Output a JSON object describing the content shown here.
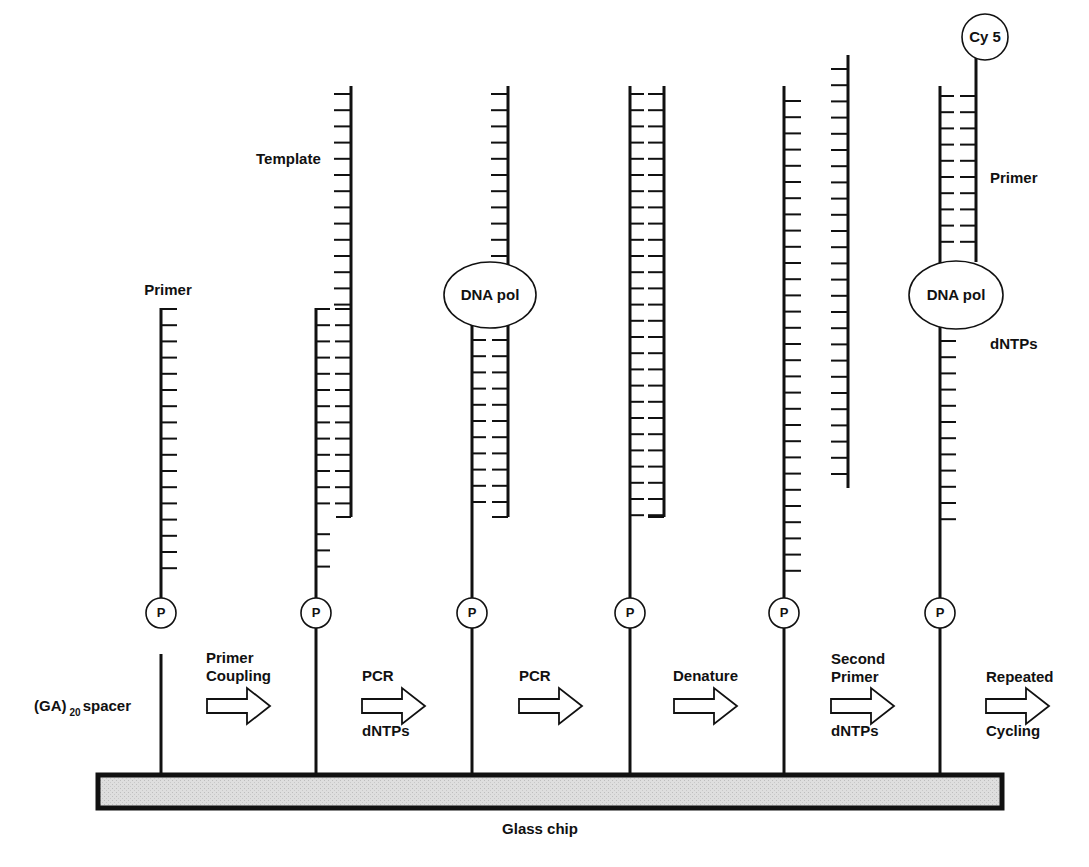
{
  "figure": {
    "chip_label": "Glass chip",
    "spacer_label": {
      "prefix": "(GA)",
      "subscript": "20",
      "suffix": "spacer"
    },
    "colors": {
      "ink": "#111111",
      "chip_fill": "#dcdcdc",
      "background": "#ffffff"
    }
  },
  "strand_labels": {
    "primer_step1": "Primer",
    "template_step2": "Template",
    "primer_step6": "Primer",
    "dntps_step6": "dNTPs"
  },
  "enzymes": {
    "step3": "DNA pol",
    "step6": "DNA pol"
  },
  "marker": {
    "phosphate": "P",
    "dye": "Cy 5"
  },
  "steps": [
    {
      "id": "step1",
      "x": 161,
      "arrow_top": "Primer Coupling",
      "arrow_bottom": ""
    },
    {
      "id": "step2",
      "x": 316,
      "arrow_top": "PCR",
      "arrow_bottom": "dNTPs"
    },
    {
      "id": "step3",
      "x": 472,
      "arrow_top": "PCR",
      "arrow_bottom": ""
    },
    {
      "id": "step4",
      "x": 630,
      "arrow_top": "Denature",
      "arrow_bottom": ""
    },
    {
      "id": "step5",
      "x": 784,
      "arrow_top": "Second Primer",
      "arrow_bottom": "dNTPs"
    },
    {
      "id": "step6",
      "x": 940,
      "arrow_top": "Repeated",
      "arrow_bottom": "Cycling"
    }
  ],
  "arrows": [
    {
      "from": "step1",
      "top_line1": "Primer",
      "top_line2": "Coupling",
      "bottom": ""
    },
    {
      "from": "step2",
      "top_line1": "PCR",
      "top_line2": "",
      "bottom": "dNTPs"
    },
    {
      "from": "step3",
      "top_line1": "PCR",
      "top_line2": "",
      "bottom": ""
    },
    {
      "from": "step4",
      "top_line1": "Denature",
      "top_line2": "",
      "bottom": ""
    },
    {
      "from": "step5",
      "top_line1": "Second",
      "top_line2": "Primer",
      "bottom": "dNTPs"
    },
    {
      "from": "step6",
      "top_line1": "Repeated",
      "top_line2": "",
      "bottom": "Cycling"
    }
  ]
}
